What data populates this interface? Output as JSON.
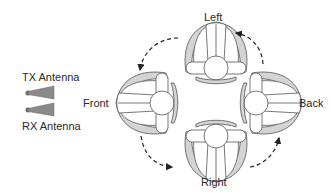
{
  "antennas": {
    "tx_label": "TX Antenna",
    "rx_label": "RX Antenna"
  },
  "orientations": {
    "left": "Left",
    "front": "Front",
    "back": "Back",
    "right": "Right"
  },
  "colors": {
    "shade": "#d4d4d4",
    "stroke": "#555555",
    "antenna": "#7a7a7a",
    "arrow": "#222222"
  }
}
